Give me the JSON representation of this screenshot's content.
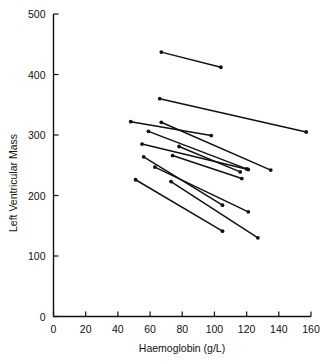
{
  "chart_data": {
    "type": "line",
    "title": "",
    "xlabel": "Haemoglobin (g/L)",
    "ylabel": "Left Ventricular Mass",
    "xlim": [
      0,
      160
    ],
    "ylim": [
      0,
      500
    ],
    "xticks": [
      0,
      20,
      40,
      60,
      80,
      100,
      120,
      140,
      160
    ],
    "yticks": [
      0,
      100,
      200,
      300,
      400,
      500
    ],
    "xtick_labels": [
      "0",
      "20",
      "40",
      "60",
      "80",
      "100",
      "120",
      "140",
      "160"
    ],
    "ytick_labels": [
      "0",
      "100",
      "200",
      "300",
      "400",
      "500"
    ],
    "grid": false,
    "legend": null,
    "marker": "filled-circle",
    "series": [
      {
        "name": "subject-1",
        "x": [
          67,
          104
        ],
        "y": [
          437,
          412
        ]
      },
      {
        "name": "subject-2",
        "x": [
          66,
          157
        ],
        "y": [
          360,
          305
        ]
      },
      {
        "name": "subject-3",
        "x": [
          48,
          98
        ],
        "y": [
          322,
          299
        ]
      },
      {
        "name": "subject-4",
        "x": [
          67,
          135
        ],
        "y": [
          321,
          242
        ]
      },
      {
        "name": "subject-5",
        "x": [
          59,
          120
        ],
        "y": [
          306,
          244
        ]
      },
      {
        "name": "subject-6",
        "x": [
          55,
          121
        ],
        "y": [
          285,
          243
        ]
      },
      {
        "name": "subject-7",
        "x": [
          78,
          116
        ],
        "y": [
          281,
          239
        ]
      },
      {
        "name": "subject-8",
        "x": [
          74,
          117
        ],
        "y": [
          266,
          228
        ]
      },
      {
        "name": "subject-9",
        "x": [
          56,
          105
        ],
        "y": [
          264,
          184
        ]
      },
      {
        "name": "subject-10",
        "x": [
          63,
          121
        ],
        "y": [
          247,
          173
        ]
      },
      {
        "name": "subject-11",
        "x": [
          51,
          105
        ],
        "y": [
          226,
          141
        ]
      },
      {
        "name": "subject-12",
        "x": [
          73,
          127
        ],
        "y": [
          223,
          130
        ]
      }
    ]
  },
  "axes": {
    "x_axis_name": "haemoglobin-axis",
    "y_axis_name": "left-ventricular-mass-axis"
  }
}
